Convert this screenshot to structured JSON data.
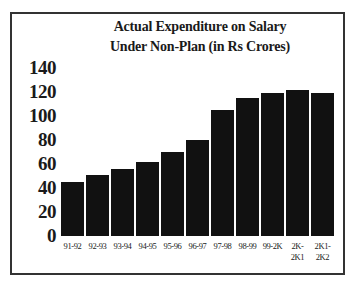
{
  "chart_data": {
    "type": "bar",
    "title_lines": [
      "Actual Expenditure on Salary",
      "Under Non-Plan (in Rs Crores)"
    ],
    "xlabel": "",
    "ylabel": "",
    "categories": [
      "91-92",
      "92-93",
      "93-94",
      "94-95",
      "95-96",
      "96-97",
      "97-98",
      "98-99",
      "99-2K",
      "2K-2K1",
      "2K1-2K2"
    ],
    "category_lines": [
      [
        "91-92"
      ],
      [
        "92-93"
      ],
      [
        "93-94"
      ],
      [
        "94-95"
      ],
      [
        "95-96"
      ],
      [
        "96-97"
      ],
      [
        "97-98"
      ],
      [
        "98-99"
      ],
      [
        "99-2K"
      ],
      [
        "2K-",
        "2K1"
      ],
      [
        "2K1-",
        "2K2"
      ]
    ],
    "values": [
      45,
      51,
      56,
      62,
      70,
      80,
      105,
      115,
      119,
      122,
      119
    ],
    "ylim": [
      0,
      140
    ],
    "yticks": [
      "0",
      "20",
      "40",
      "60",
      "80",
      "100",
      "120",
      "140"
    ],
    "grid": false,
    "legend": null,
    "bar_color": "#111111"
  }
}
